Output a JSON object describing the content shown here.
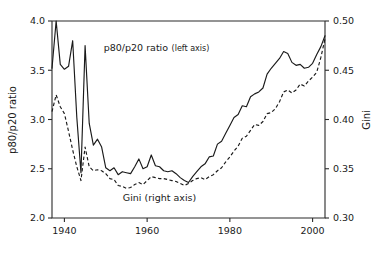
{
  "chart_data": {
    "type": "line",
    "title": "",
    "xlabel": "",
    "grid": false,
    "legend_position": "inline-annotations",
    "xlim": [
      1937,
      2003
    ],
    "x_ticks": [
      1940,
      1960,
      1980,
      2000
    ],
    "x_tick_labels": [
      "1940",
      "1960",
      "1980",
      "2000"
    ],
    "left_axis": {
      "label": "p80/p20 ratio",
      "ylim": [
        2.0,
        4.0
      ],
      "ticks": [
        2.0,
        2.5,
        3.0,
        3.5,
        4.0
      ],
      "tick_labels": [
        "2.0",
        "2.5",
        "3.0",
        "3.5",
        "4.0"
      ]
    },
    "right_axis": {
      "label": "Gini",
      "ylim": [
        0.3,
        0.5
      ],
      "ticks": [
        0.3,
        0.35,
        0.4,
        0.45,
        0.5
      ],
      "tick_labels": [
        "0.30",
        "0.35",
        "0.40",
        "0.45",
        "0.50"
      ]
    },
    "annotations": [
      {
        "name": "p80p20-annotation",
        "main": "p80/p20 ratio",
        "sub": "(left axis)",
        "x": 1949.5,
        "y_left": 3.7
      },
      {
        "name": "gini-annotation",
        "main": "Gini (right axis)",
        "sub": "",
        "x": 1963.0,
        "y_left": 2.17
      }
    ],
    "x": [
      1937,
      1938,
      1939,
      1940,
      1941,
      1942,
      1943,
      1944,
      1945,
      1946,
      1947,
      1948,
      1949,
      1950,
      1951,
      1952,
      1953,
      1954,
      1955,
      1956,
      1957,
      1958,
      1959,
      1960,
      1961,
      1962,
      1963,
      1964,
      1965,
      1966,
      1967,
      1968,
      1969,
      1970,
      1971,
      1972,
      1973,
      1974,
      1975,
      1976,
      1977,
      1978,
      1979,
      1980,
      1981,
      1982,
      1983,
      1984,
      1985,
      1986,
      1987,
      1988,
      1989,
      1990,
      1991,
      1992,
      1993,
      1994,
      1995,
      1996,
      1997,
      1998,
      1999,
      2000,
      2001,
      2002,
      2003
    ],
    "series": [
      {
        "name": "p80/p20 ratio",
        "axis": "left",
        "style": "solid",
        "values": [
          3.52,
          4.0,
          3.56,
          3.51,
          3.54,
          3.8,
          3.02,
          2.46,
          3.75,
          2.96,
          2.74,
          2.8,
          2.72,
          2.51,
          2.48,
          2.51,
          2.44,
          2.47,
          2.46,
          2.45,
          2.52,
          2.6,
          2.5,
          2.52,
          2.64,
          2.53,
          2.52,
          2.48,
          2.47,
          2.48,
          2.45,
          2.41,
          2.38,
          2.36,
          2.42,
          2.47,
          2.52,
          2.55,
          2.62,
          2.63,
          2.75,
          2.78,
          2.86,
          2.94,
          3.02,
          3.05,
          3.14,
          3.13,
          3.23,
          3.26,
          3.28,
          3.32,
          3.46,
          3.52,
          3.57,
          3.62,
          3.69,
          3.67,
          3.58,
          3.55,
          3.56,
          3.52,
          3.53,
          3.57,
          3.66,
          3.74,
          3.85
        ]
      },
      {
        "name": "Gini",
        "axis": "right",
        "style": "dashed",
        "values": [
          0.408,
          0.425,
          0.413,
          0.406,
          0.388,
          0.369,
          0.352,
          0.338,
          0.372,
          0.352,
          0.348,
          0.349,
          0.348,
          0.345,
          0.34,
          0.339,
          0.333,
          0.332,
          0.33,
          0.331,
          0.334,
          0.336,
          0.334,
          0.338,
          0.342,
          0.341,
          0.34,
          0.34,
          0.339,
          0.338,
          0.337,
          0.335,
          0.333,
          0.335,
          0.338,
          0.34,
          0.341,
          0.339,
          0.342,
          0.344,
          0.348,
          0.351,
          0.357,
          0.362,
          0.368,
          0.373,
          0.381,
          0.383,
          0.389,
          0.395,
          0.394,
          0.398,
          0.406,
          0.407,
          0.411,
          0.418,
          0.428,
          0.43,
          0.427,
          0.43,
          0.436,
          0.434,
          0.439,
          0.443,
          0.448,
          0.463,
          0.482
        ]
      }
    ]
  }
}
